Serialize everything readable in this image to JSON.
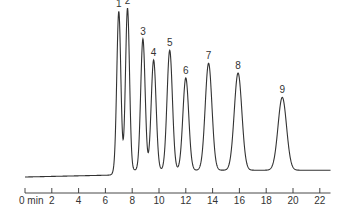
{
  "chart_data": {
    "type": "line",
    "title": "",
    "xlabel": "min",
    "ylabel": "",
    "xlim": [
      0,
      23
    ],
    "grid": false,
    "legend": "none",
    "x_ticks": [
      0,
      2,
      4,
      6,
      8,
      10,
      12,
      14,
      16,
      18,
      20,
      22
    ],
    "x_tick_labels": [
      "0 min",
      "2",
      "4",
      "6",
      "8",
      "10",
      "12",
      "14",
      "16",
      "18",
      "20",
      "22"
    ],
    "baseline": {
      "start_level": 0.0,
      "rise_at_min": 6.6,
      "plateau_level": 0.03
    },
    "peaks": [
      {
        "label": "1",
        "retention_min": 7.0,
        "relative_height": 0.98,
        "width_min": 0.18
      },
      {
        "label": "2",
        "retention_min": 7.65,
        "relative_height": 1.0,
        "width_min": 0.18
      },
      {
        "label": "3",
        "retention_min": 8.8,
        "relative_height": 0.81,
        "width_min": 0.2
      },
      {
        "label": "4",
        "retention_min": 9.6,
        "relative_height": 0.68,
        "width_min": 0.22
      },
      {
        "label": "5",
        "retention_min": 10.8,
        "relative_height": 0.74,
        "width_min": 0.24
      },
      {
        "label": "6",
        "retention_min": 12.0,
        "relative_height": 0.57,
        "width_min": 0.26
      },
      {
        "label": "7",
        "retention_min": 13.7,
        "relative_height": 0.66,
        "width_min": 0.3
      },
      {
        "label": "8",
        "retention_min": 15.9,
        "relative_height": 0.6,
        "width_min": 0.34
      },
      {
        "label": "9",
        "retention_min": 19.2,
        "relative_height": 0.45,
        "width_min": 0.38
      }
    ]
  },
  "axis": {
    "unit_label": "min"
  },
  "colors": {
    "line": "#333333",
    "background": "#ffffff"
  }
}
